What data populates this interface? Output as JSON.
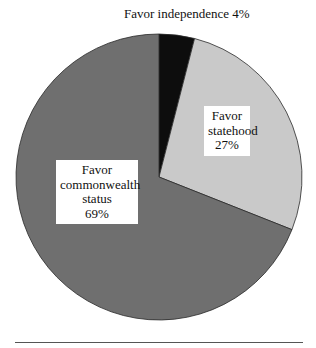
{
  "chart_data": {
    "type": "pie",
    "title": "",
    "categories": [
      "Favor independence",
      "Favor statehood",
      "Favor commonwealth status"
    ],
    "values": [
      4,
      27,
      69
    ],
    "unit": "%",
    "start_angle_deg": 0,
    "direction": "clockwise",
    "colors": [
      "#0d0d0d",
      "#c9c9c9",
      "#6f6f6f"
    ],
    "legend": "none",
    "labels": {
      "independence": {
        "line1": "Favor independence 4%"
      },
      "statehood": {
        "line1": "Favor",
        "line2": "statehood",
        "line3": "27%"
      },
      "commonwealth": {
        "line1": "Favor",
        "line2": "commonwealth",
        "line3": "status",
        "line4": "69%"
      }
    }
  },
  "geometry": {
    "cx": 159,
    "cy": 177,
    "r": 143
  }
}
